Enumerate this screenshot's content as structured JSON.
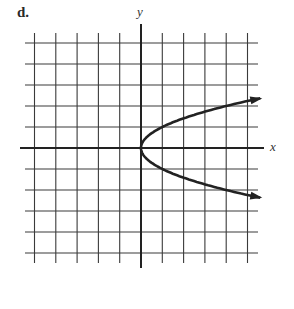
{
  "part_label": "d.",
  "chart_data": {
    "type": "line",
    "title": "",
    "xlabel": "x",
    "ylabel": "y",
    "xlim": [
      -5,
      5
    ],
    "ylim": [
      -5,
      5
    ],
    "grid": true,
    "grid_step": 1,
    "series": [
      {
        "name": "upper branch (y = sqrt(x))",
        "x": [
          0,
          0.25,
          1,
          2,
          3,
          4,
          5,
          5.6
        ],
        "y": [
          0,
          0.5,
          1,
          1.41,
          1.73,
          2.0,
          2.24,
          2.37
        ],
        "arrow_end": true
      },
      {
        "name": "lower branch (y = -sqrt(x))",
        "x": [
          0,
          0.25,
          1,
          2,
          3,
          4,
          5,
          5.6
        ],
        "y": [
          0,
          -0.5,
          -1,
          -1.41,
          -1.73,
          -2.0,
          -2.24,
          -2.37
        ],
        "arrow_end": true
      }
    ],
    "annotations": [
      "Sideways parabola x = y^2 opening to the right, vertex at origin"
    ]
  },
  "colors": {
    "grid": "#3a3a3a",
    "axis": "#222222",
    "curve": "#222222"
  }
}
